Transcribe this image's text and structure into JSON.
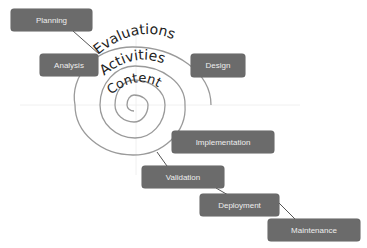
{
  "diagram": {
    "title": "",
    "type": "spiral-process",
    "spiral_labels": {
      "outer": "Evaluations",
      "middle": "Activities",
      "inner": "Content"
    },
    "phases": [
      {
        "id": "planning",
        "label": "Planning"
      },
      {
        "id": "analysis",
        "label": "Analysis"
      },
      {
        "id": "design",
        "label": "Design"
      },
      {
        "id": "implementation",
        "label": "Implementation"
      },
      {
        "id": "validation",
        "label": "Validation"
      },
      {
        "id": "deployment",
        "label": "Deployment"
      },
      {
        "id": "maintenance",
        "label": "Maintenance"
      }
    ],
    "colors": {
      "node_fill": "#6b6b6b",
      "node_text": "#eeeeee",
      "line": "#555555",
      "spiral": "#9a9a9a",
      "guide": "#e6e6e6"
    }
  }
}
